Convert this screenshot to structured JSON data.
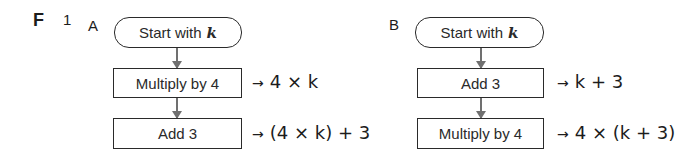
{
  "section_label": "F",
  "question_number": "1",
  "flowcharts": [
    {
      "label": "A",
      "start": {
        "text": "Start with",
        "variable": "k"
      },
      "steps": [
        {
          "text": "Multiply by 4",
          "arrow": "→",
          "result": "4 × k"
        },
        {
          "text": "Add 3",
          "arrow": "→",
          "result": "(4 × k) + 3"
        }
      ]
    },
    {
      "label": "B",
      "start": {
        "text": "Start with",
        "variable": "k"
      },
      "steps": [
        {
          "text": "Add 3",
          "arrow": "→",
          "result": "k + 3"
        },
        {
          "text": "Multiply by 4",
          "arrow": "→",
          "result": "4 × (k + 3)"
        }
      ]
    }
  ]
}
